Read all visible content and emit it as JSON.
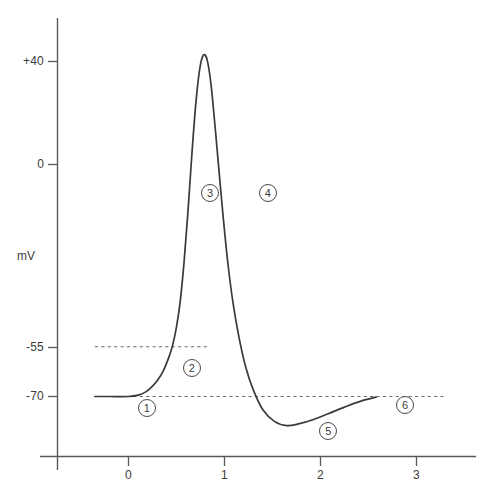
{
  "chart_data": {
    "type": "line",
    "title": "",
    "xlabel": "",
    "ylabel": "mV",
    "xlim": [
      -0.35,
      3.35
    ],
    "ylim": [
      -95,
      52
    ],
    "grid": false,
    "legend": null,
    "x_ticks": [
      {
        "value": 0,
        "label": "0"
      },
      {
        "value": 1,
        "label": "1"
      },
      {
        "value": 2,
        "label": "2"
      },
      {
        "value": 3,
        "label": "3"
      }
    ],
    "y_ticks": [
      {
        "value": 40,
        "label": "+40"
      },
      {
        "value": 0,
        "label": "0"
      },
      {
        "value": -55,
        "label": "-55"
      },
      {
        "value": -70,
        "label": "-70"
      }
    ],
    "reference_lines": [
      {
        "name": "threshold",
        "value": -55,
        "label": "-55",
        "style": "dashed",
        "x_start": -0.35,
        "x_end": 0.82
      },
      {
        "name": "resting-potential",
        "value": -70,
        "label": "-70",
        "style": "dashed",
        "x_start": -0.35,
        "x_end": 3.28
      }
    ],
    "series": [
      {
        "name": "membrane-potential",
        "x": [
          -0.35,
          -0.2,
          0.0,
          0.1,
          0.18,
          0.24,
          0.3,
          0.36,
          0.42,
          0.46,
          0.5,
          0.54,
          0.58,
          0.62,
          0.66,
          0.7,
          0.74,
          0.78,
          0.82,
          0.86,
          0.9,
          0.94,
          0.99,
          1.04,
          1.09,
          1.15,
          1.22,
          1.3,
          1.4,
          1.52,
          1.65,
          1.78,
          1.92,
          2.08,
          2.25,
          2.42,
          2.58
        ],
        "y": [
          -70,
          -70,
          -70,
          -69.6,
          -68.6,
          -67.2,
          -65.2,
          -62.4,
          -58.2,
          -54.5,
          -49.0,
          -41.0,
          -29.0,
          -14.0,
          3.0,
          18.0,
          28.5,
          33.0,
          31.5,
          24.0,
          12.0,
          -1.0,
          -17.0,
          -31.0,
          -42.0,
          -52.0,
          -61.0,
          -68.0,
          -74.0,
          -77.5,
          -78.8,
          -78.2,
          -77.0,
          -75.2,
          -73.2,
          -71.4,
          -70.2
        ]
      }
    ],
    "annotations": [
      {
        "id": "1",
        "label": "1",
        "x": 0.19,
        "y": -73.5,
        "description": "resting-potential-phase"
      },
      {
        "id": "2",
        "label": "2",
        "x": 0.66,
        "y": -61.5,
        "description": "threshold-phase"
      },
      {
        "id": "3",
        "label": "3",
        "x": 0.85,
        "y": -8.5,
        "description": "depolarization-phase"
      },
      {
        "id": "4",
        "label": "4",
        "x": 1.45,
        "y": -8.5,
        "description": "repolarization-phase"
      },
      {
        "id": "5",
        "label": "5",
        "x": 2.08,
        "y": -80.5,
        "description": "hyperpolarization-phase"
      },
      {
        "id": "6",
        "label": "6",
        "x": 2.88,
        "y": -72.4,
        "description": "return-to-resting-phase"
      }
    ],
    "colors": {
      "curve": "#3a3a3a",
      "axis": "#5a5a5a",
      "dashed": "#6b6b6b",
      "text": "#3c3c3c",
      "background": "#ffffff"
    }
  }
}
